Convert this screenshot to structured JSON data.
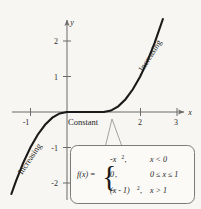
{
  "figure": {
    "name": "piecewise-function-graph",
    "background_color": "#f7f6f2",
    "curve_color": "#1a1a1a",
    "axis_color": "#6b6b6b"
  },
  "chart_data": {
    "type": "line",
    "title": "",
    "xlabel": "x",
    "ylabel": "y",
    "xlim": [
      -1.55,
      3.65
    ],
    "ylim": [
      -2.55,
      2.85
    ],
    "grid": false,
    "legend": null,
    "x_ticks": [
      -1,
      2,
      3
    ],
    "x_tick_labels": [
      "-1",
      "2",
      "3"
    ],
    "y_ticks": [
      2,
      1,
      -1,
      -2
    ],
    "y_tick_labels": [
      "2",
      "1",
      "-1",
      "-2"
    ],
    "series": [
      {
        "name": "f(x) = -x^2 for x < 0",
        "expression": "-x^2",
        "domain": [
          -1.52,
          0
        ],
        "points_x": [
          -1.52,
          -1.4,
          -1.2,
          -1.0,
          -0.8,
          -0.6,
          -0.4,
          -0.2,
          0
        ],
        "points_y": [
          -2.31,
          -1.96,
          -1.44,
          -1.0,
          -0.64,
          -0.36,
          -0.16,
          -0.04,
          0
        ]
      },
      {
        "name": "f(x) = 0 for 0 <= x <= 1",
        "expression": "0",
        "domain": [
          0,
          1
        ],
        "points_x": [
          0,
          0.25,
          0.5,
          0.75,
          1
        ],
        "points_y": [
          0,
          0,
          0,
          0,
          0
        ]
      },
      {
        "name": "f(x) = (x-1)^2 for x > 1",
        "expression": "(x-1)^2",
        "domain": [
          1,
          2.62
        ],
        "points_x": [
          1,
          1.2,
          1.4,
          1.6,
          1.8,
          2.0,
          2.2,
          2.4,
          2.62
        ],
        "points_y": [
          0,
          0.04,
          0.16,
          0.36,
          0.64,
          1.0,
          1.44,
          1.96,
          2.62
        ]
      }
    ],
    "annotations": [
      {
        "text": "Increasing",
        "x": -1.05,
        "y": -1.5,
        "rotation": -56
      },
      {
        "text": "Constant",
        "x": 0.02,
        "y": -0.3,
        "rotation": 0
      },
      {
        "text": "Increasing",
        "x": 2.2,
        "y": 1.75,
        "rotation": -58
      }
    ],
    "callout": {
      "target_x": 1.22,
      "target_y": 0.05,
      "formula_label": "f(x) =",
      "rows": [
        {
          "value": "-x",
          "exponent": "2",
          "comma": ",",
          "condition": "x < 0"
        },
        {
          "value": "0",
          "exponent": "",
          "comma": ",",
          "condition": "0 ≤ x ≤ 1"
        },
        {
          "value": "(x - 1)",
          "exponent": "2",
          "comma": ",",
          "condition": "x > 1"
        }
      ]
    }
  }
}
